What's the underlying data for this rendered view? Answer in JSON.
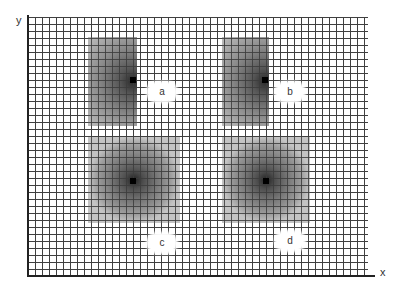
{
  "axes": {
    "x_label": "x",
    "y_label": "y"
  },
  "grid": {
    "cell_size_px": 7,
    "line_color": "#555555"
  },
  "regions": [
    {
      "label": "a",
      "shape": "tall-rectangle",
      "gradient": "darkest at right-center point"
    },
    {
      "label": "b",
      "shape": "tall-rectangle",
      "gradient": "darkest at right-center point"
    },
    {
      "label": "c",
      "shape": "square",
      "gradient": "darkest at center point"
    },
    {
      "label": "d",
      "shape": "square",
      "gradient": "darkest at center point"
    }
  ]
}
